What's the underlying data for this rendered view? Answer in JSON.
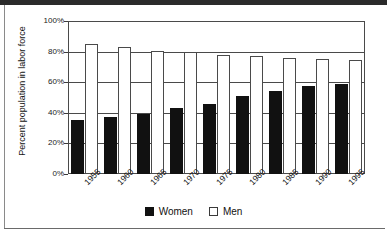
{
  "chart_data": {
    "type": "bar",
    "title": "",
    "subtitle": "",
    "xlabel": "",
    "ylabel": "Percent population in labor force",
    "categories": [
      "1955",
      "1960",
      "1965",
      "1970",
      "1975",
      "1980",
      "1985",
      "1990",
      "1995"
    ],
    "series": [
      {
        "name": "Women",
        "color": "#111111",
        "values": [
          35.5,
          37.5,
          39.5,
          43.0,
          46.0,
          51.0,
          54.0,
          57.5,
          59.0
        ]
      },
      {
        "name": "Men",
        "color": "#ffffff",
        "values": [
          85.0,
          83.0,
          80.5,
          79.5,
          77.5,
          77.0,
          76.0,
          75.5,
          74.5
        ]
      }
    ],
    "ylim": [
      0,
      100
    ],
    "yticks": [
      "0%",
      "20%",
      "40%",
      "60%",
      "80%",
      "100%"
    ],
    "ytick_values": [
      0,
      20,
      40,
      60,
      80,
      100
    ],
    "grid": true,
    "legend_position": "bottom",
    "value_suffix": "%"
  },
  "legend": {
    "items": [
      {
        "label": "Women",
        "swatch": "filled-square-icon"
      },
      {
        "label": "Men",
        "swatch": "outlined-square-icon"
      }
    ]
  }
}
